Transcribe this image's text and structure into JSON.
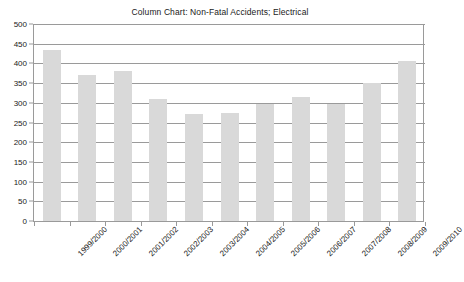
{
  "chart_data": {
    "type": "bar",
    "title": "Column Chart: Non-Fatal Accidents; Electrical",
    "xlabel": "",
    "ylabel": "",
    "ylim": [
      0,
      500
    ],
    "ytick_step": 50,
    "grid": true,
    "legend": "none",
    "bar_color": "#d9d9d9",
    "axis_color": "#9a9a9a",
    "categories": [
      "1999/2000",
      "2000/2001",
      "2001/2002",
      "2002/2003",
      "2003/2004",
      "2004/2005",
      "2005/2006",
      "2006/2007",
      "2007/2008",
      "2008/2009",
      "2009/2010"
    ],
    "values": [
      435,
      370,
      380,
      310,
      272,
      275,
      297,
      315,
      297,
      350,
      405
    ],
    "yticks": [
      0,
      50,
      100,
      150,
      200,
      250,
      300,
      350,
      400,
      450,
      500
    ],
    "ytick_labels": [
      "0",
      "50",
      "100",
      "150",
      "200",
      "250",
      "300",
      "350",
      "400",
      "450",
      "500"
    ]
  }
}
